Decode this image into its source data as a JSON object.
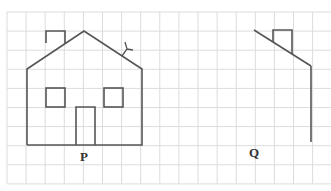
{
  "figure": {
    "labels": {
      "left": "P",
      "right": "Q"
    },
    "grid": {
      "x0": 7,
      "y0": 12,
      "cell": 19.1,
      "cols": 17,
      "rows": 9,
      "color": "#d9d9d9"
    },
    "line_color": "#555555"
  }
}
